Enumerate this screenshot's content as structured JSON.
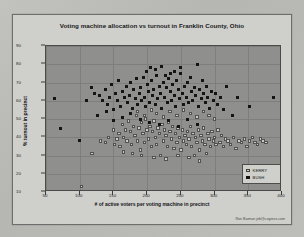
{
  "chart_data": {
    "type": "scatter",
    "title": "Voting machine allocation vs turnout in Franklin County, Ohio",
    "xlabel": "# of active voters per voting machine in precinct",
    "ylabel": "% turnout in precinct",
    "xlim": [
      50,
      400
    ],
    "ylim": [
      10,
      90
    ],
    "xticks": [
      50,
      100,
      150,
      200,
      250,
      300,
      350,
      400
    ],
    "yticks": [
      10,
      20,
      30,
      40,
      50,
      60,
      70,
      80,
      90
    ],
    "grid": true,
    "legend_position": "bottom-right",
    "colors": {
      "bush": "#141414",
      "kerry": "#c9c9c5",
      "plot_background": "#8f8f8d",
      "chart_background": "#cfcfcc"
    },
    "series": [
      {
        "name": "KERRY",
        "marker": "open-square",
        "points": [
          [
            103,
            13
          ],
          [
            118,
            31
          ],
          [
            131,
            38
          ],
          [
            138,
            37
          ],
          [
            143,
            40
          ],
          [
            150,
            44
          ],
          [
            152,
            36
          ],
          [
            155,
            39
          ],
          [
            158,
            42
          ],
          [
            160,
            35
          ],
          [
            163,
            47
          ],
          [
            165,
            40
          ],
          [
            168,
            44
          ],
          [
            170,
            38
          ],
          [
            172,
            49
          ],
          [
            175,
            43
          ],
          [
            177,
            36
          ],
          [
            180,
            46
          ],
          [
            182,
            41
          ],
          [
            184,
            52
          ],
          [
            186,
            38
          ],
          [
            188,
            45
          ],
          [
            190,
            33
          ],
          [
            192,
            48
          ],
          [
            194,
            42
          ],
          [
            196,
            37
          ],
          [
            198,
            50
          ],
          [
            200,
            44
          ],
          [
            202,
            39
          ],
          [
            204,
            46
          ],
          [
            206,
            35
          ],
          [
            208,
            43
          ],
          [
            210,
            49
          ],
          [
            212,
            40
          ],
          [
            214,
            36
          ],
          [
            216,
            45
          ],
          [
            218,
            42
          ],
          [
            220,
            30
          ],
          [
            222,
            47
          ],
          [
            224,
            38
          ],
          [
            226,
            44
          ],
          [
            228,
            41
          ],
          [
            230,
            35
          ],
          [
            232,
            48
          ],
          [
            234,
            43
          ],
          [
            236,
            39
          ],
          [
            238,
            46
          ],
          [
            240,
            34
          ],
          [
            242,
            42
          ],
          [
            244,
            37
          ],
          [
            246,
            45
          ],
          [
            248,
            40
          ],
          [
            250,
            33
          ],
          [
            252,
            44
          ],
          [
            254,
            38
          ],
          [
            256,
            41
          ],
          [
            258,
            36
          ],
          [
            260,
            43
          ],
          [
            262,
            39
          ],
          [
            264,
            46
          ],
          [
            266,
            35
          ],
          [
            268,
            42
          ],
          [
            270,
            30
          ],
          [
            272,
            40
          ],
          [
            274,
            37
          ],
          [
            276,
            44
          ],
          [
            278,
            33
          ],
          [
            280,
            41
          ],
          [
            282,
            38
          ],
          [
            284,
            45
          ],
          [
            286,
            36
          ],
          [
            288,
            31
          ],
          [
            290,
            42
          ],
          [
            292,
            39
          ],
          [
            294,
            35
          ],
          [
            296,
            43
          ],
          [
            298,
            38
          ],
          [
            300,
            40
          ],
          [
            302,
            36
          ],
          [
            305,
            44
          ],
          [
            308,
            37
          ],
          [
            310,
            41
          ],
          [
            313,
            35
          ],
          [
            316,
            39
          ],
          [
            320,
            38
          ],
          [
            324,
            36
          ],
          [
            328,
            40
          ],
          [
            332,
            34
          ],
          [
            336,
            38
          ],
          [
            340,
            37
          ],
          [
            344,
            39
          ],
          [
            348,
            35
          ],
          [
            352,
            38
          ],
          [
            356,
            40
          ],
          [
            360,
            37
          ],
          [
            364,
            36
          ],
          [
            368,
            39
          ],
          [
            372,
            38
          ],
          [
            376,
            37
          ],
          [
            186,
            54
          ],
          [
            196,
            52
          ],
          [
            206,
            55
          ],
          [
            214,
            53
          ],
          [
            224,
            51
          ],
          [
            234,
            54
          ],
          [
            244,
            52
          ],
          [
            254,
            55
          ],
          [
            264,
            53
          ],
          [
            274,
            51
          ],
          [
            284,
            54
          ],
          [
            292,
            52
          ],
          [
            300,
            50
          ],
          [
            210,
            29
          ],
          [
            228,
            28
          ],
          [
            246,
            30
          ],
          [
            262,
            29
          ],
          [
            278,
            27
          ],
          [
            165,
            32
          ],
          [
            178,
            31
          ],
          [
            192,
            30
          ]
        ]
      },
      {
        "name": "BUSH",
        "marker": "filled-square",
        "points": [
          [
            63,
            61
          ],
          [
            72,
            45
          ],
          [
            100,
            38
          ],
          [
            110,
            60
          ],
          [
            118,
            67
          ],
          [
            122,
            64
          ],
          [
            126,
            52
          ],
          [
            130,
            63
          ],
          [
            134,
            60
          ],
          [
            138,
            66
          ],
          [
            141,
            58
          ],
          [
            144,
            62
          ],
          [
            147,
            69
          ],
          [
            150,
            55
          ],
          [
            153,
            64
          ],
          [
            156,
            60
          ],
          [
            158,
            71
          ],
          [
            161,
            57
          ],
          [
            164,
            65
          ],
          [
            166,
            62
          ],
          [
            169,
            68
          ],
          [
            171,
            59
          ],
          [
            174,
            63
          ],
          [
            176,
            70
          ],
          [
            178,
            56
          ],
          [
            180,
            66
          ],
          [
            182,
            61
          ],
          [
            184,
            72
          ],
          [
            186,
            58
          ],
          [
            188,
            64
          ],
          [
            190,
            67
          ],
          [
            192,
            60
          ],
          [
            194,
            73
          ],
          [
            196,
            62
          ],
          [
            198,
            57
          ],
          [
            200,
            69
          ],
          [
            202,
            65
          ],
          [
            204,
            59
          ],
          [
            206,
            71
          ],
          [
            208,
            63
          ],
          [
            210,
            66
          ],
          [
            212,
            58
          ],
          [
            214,
            74
          ],
          [
            216,
            61
          ],
          [
            218,
            68
          ],
          [
            220,
            64
          ],
          [
            222,
            56
          ],
          [
            224,
            70
          ],
          [
            226,
            62
          ],
          [
            228,
            67
          ],
          [
            230,
            59
          ],
          [
            232,
            72
          ],
          [
            234,
            65
          ],
          [
            236,
            60
          ],
          [
            238,
            69
          ],
          [
            240,
            63
          ],
          [
            242,
            57
          ],
          [
            244,
            71
          ],
          [
            246,
            66
          ],
          [
            248,
            61
          ],
          [
            250,
            75
          ],
          [
            252,
            64
          ],
          [
            254,
            58
          ],
          [
            256,
            68
          ],
          [
            258,
            62
          ],
          [
            260,
            70
          ],
          [
            262,
            59
          ],
          [
            264,
            73
          ],
          [
            266,
            65
          ],
          [
            268,
            60
          ],
          [
            270,
            67
          ],
          [
            272,
            63
          ],
          [
            274,
            80
          ],
          [
            276,
            57
          ],
          [
            278,
            66
          ],
          [
            280,
            61
          ],
          [
            282,
            71
          ],
          [
            284,
            64
          ],
          [
            286,
            59
          ],
          [
            288,
            68
          ],
          [
            290,
            62
          ],
          [
            292,
            56
          ],
          [
            295,
            65
          ],
          [
            298,
            60
          ],
          [
            301,
            64
          ],
          [
            305,
            58
          ],
          [
            309,
            62
          ],
          [
            313,
            55
          ],
          [
            318,
            68
          ],
          [
            326,
            52
          ],
          [
            334,
            62
          ],
          [
            352,
            57
          ],
          [
            388,
            62
          ],
          [
            199,
            76
          ],
          [
            213,
            77
          ],
          [
            227,
            74
          ],
          [
            241,
            76
          ],
          [
            205,
            78
          ],
          [
            221,
            79
          ],
          [
            235,
            75
          ],
          [
            249,
            78
          ],
          [
            190,
            50
          ],
          [
            204,
            48
          ],
          [
            218,
            47
          ],
          [
            232,
            49
          ],
          [
            246,
            46
          ],
          [
            260,
            50
          ],
          [
            274,
            47
          ],
          [
            150,
            49
          ],
          [
            163,
            51
          ],
          [
            176,
            53
          ],
          [
            140,
            54
          ]
        ]
      }
    ]
  },
  "credit": "Ron Baiman  jeb@cogress.com"
}
